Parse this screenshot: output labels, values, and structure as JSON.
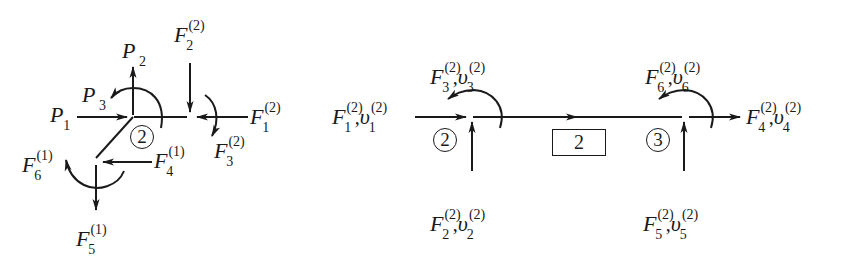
{
  "left_diagram": {
    "description": "Free-body diagram of node with element 2 (horizontal) and element 1 (diagonal) forces",
    "element_label": "2",
    "labels": {
      "P1": {
        "symbol": "P",
        "sub": "1"
      },
      "P2": {
        "symbol": "P",
        "sub": "2"
      },
      "P3": {
        "symbol": "P",
        "sub": "3"
      },
      "F2_2": {
        "symbol": "F",
        "sup": "(2)",
        "sub": "2"
      },
      "F1_2": {
        "symbol": "F",
        "sup": "(2)",
        "sub": "1"
      },
      "F3_2": {
        "symbol": "F",
        "sup": "(2)",
        "sub": "3"
      },
      "F4_1": {
        "symbol": "F",
        "sup": "(1)",
        "sub": "4"
      },
      "F5_1": {
        "symbol": "F",
        "sup": "(1)",
        "sub": "5"
      },
      "F6_1": {
        "symbol": "F",
        "sup": "(1)",
        "sub": "6"
      }
    }
  },
  "right_diagram": {
    "description": "Beam element 2 between nodes 2 and 3 with end forces and displacements",
    "element_label": "2",
    "node_left": "2",
    "node_right": "3",
    "comma": ",",
    "labels": {
      "end1": {
        "F": "F",
        "v": "υ",
        "sup": "(2)",
        "sub": "1"
      },
      "end2": {
        "F": "F",
        "v": "υ",
        "sup": "(2)",
        "sub": "2"
      },
      "end3": {
        "F": "F",
        "v": "υ",
        "sup": "(2)",
        "sub": "3"
      },
      "end4": {
        "F": "F",
        "v": "υ",
        "sup": "(2)",
        "sub": "4"
      },
      "end5": {
        "F": "F",
        "v": "υ",
        "sup": "(2)",
        "sub": "5"
      },
      "end6": {
        "F": "F",
        "v": "υ",
        "sup": "(2)",
        "sub": "6"
      }
    }
  },
  "colors": {
    "ink": "#1a1a1a",
    "background": "#ffffff"
  }
}
